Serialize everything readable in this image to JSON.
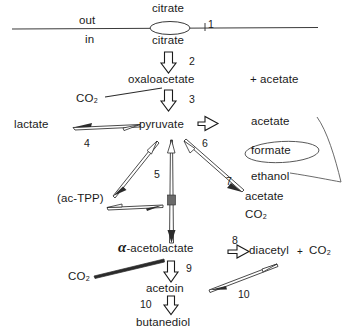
{
  "diagram": {
    "membrane": {
      "out_label": "out",
      "in_label": "in",
      "transporter_step": "1",
      "citrate_out": "citrate",
      "citrate_in": "citrate"
    },
    "metabolites": {
      "citrate_out": "citrate",
      "citrate_in": "citrate",
      "oxaloacetate": "oxaloacetate",
      "acetate_top": "+ acetate",
      "pyruvate": "pyruvate",
      "lactate": "lactate",
      "acetate_right": "acetate",
      "formate": "formate",
      "ethanol": "ethanol",
      "acetate_7": "acetate",
      "co2_7": "CO₂",
      "ac_tpp": "(ac-TPP)",
      "alpha_symbol": "α",
      "acetolactate": "-acetolactate",
      "diacetyl": "diacetyl",
      "co2_diacetyl": "CO₂",
      "plus_diacetyl": "+",
      "acetoin": "acetoin",
      "butanediol": "butanediol",
      "co2_step3": "CO₂",
      "co2_step9": "CO₂"
    },
    "steps": {
      "s1": "1",
      "s2": "2",
      "s3": "3",
      "s4": "4",
      "s5": "5",
      "s6": "6",
      "s7": "7",
      "s8": "8",
      "s9": "9",
      "s10_left": "10",
      "s10_right": "10"
    },
    "annotations": {
      "formate_circle": "hand-drawn-ellipse-around-formate",
      "bracket": "hand-drawn-bracket-right-of-products"
    },
    "colors": {
      "ink": "#1a1a1a",
      "line": "#333333",
      "background": "#ffffff"
    }
  }
}
